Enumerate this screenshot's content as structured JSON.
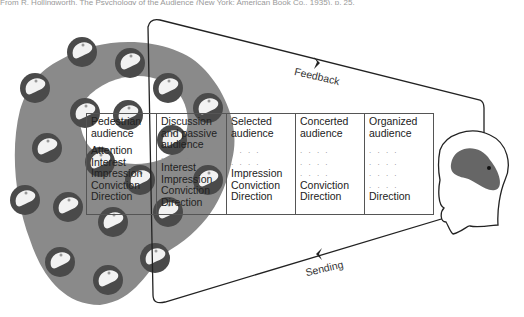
{
  "caption": "From R. Hollingworth, The Psychology of the Audience (New York: American Book Co., 1935), p. 25.",
  "labels": {
    "feedback": "Feedback",
    "sending": "Sending"
  },
  "colors": {
    "crowd_fill": "#8a8a8a",
    "head_dark": "#4a4a4a",
    "head_light": "#f2f2f2",
    "line": "#222222",
    "speaker_brain": "#666666"
  },
  "table": {
    "columns": [
      {
        "header": "Pedestrian audience",
        "rows": [
          "Attention",
          "Interest",
          "Impression",
          "Conviction",
          "Direction"
        ]
      },
      {
        "header": "Discussion and passive audience",
        "rows": [
          ". . . .",
          "Interest",
          "Impression",
          "Conviction",
          "Direction"
        ]
      },
      {
        "header": "Selected audience",
        "rows": [
          ". . . .",
          ". . . .",
          "Impression",
          "Conviction",
          "Direction"
        ]
      },
      {
        "header": "Concerted audience",
        "rows": [
          ". . . .",
          ". . . .",
          ". . . .",
          "Conviction",
          "Direction"
        ]
      },
      {
        "header": "Organized audience",
        "rows": [
          ". . . .",
          ". . . .",
          ". . . .",
          ". . . .",
          "Direction"
        ]
      }
    ]
  }
}
